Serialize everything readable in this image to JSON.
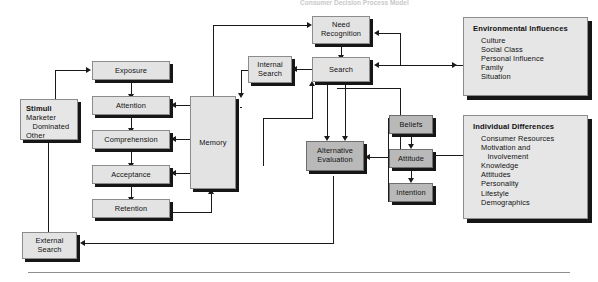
{
  "figure": {
    "title": "Consumer Decision Process Model",
    "title_clipped": true
  },
  "nodes": {
    "stimuli": {
      "title": "Stimuli",
      "lines": [
        "Marketer",
        "   Dominated",
        "Other"
      ]
    },
    "exposure": {
      "label": "Exposure"
    },
    "attention": {
      "label": "Attention"
    },
    "comprehension": {
      "label": "Comprehension"
    },
    "acceptance": {
      "label": "Acceptance"
    },
    "retention": {
      "label": "Retention"
    },
    "memory": {
      "label": "Memory"
    },
    "external_search": {
      "label": "External\nSearch",
      "line1": "External",
      "line2": "Search"
    },
    "internal_search": {
      "label": "Internal\nSearch",
      "line1": "Internal",
      "line2": "Search"
    },
    "need_recognition": {
      "line1": "Need",
      "line2": "Recognition"
    },
    "search": {
      "label": "Search"
    },
    "alternative_evaluation": {
      "line1": "Alternative",
      "line2": "Evaluation"
    },
    "beliefs": {
      "label": "Beliefs"
    },
    "attitude": {
      "label": "Attitude"
    },
    "intention": {
      "label": "Intention"
    }
  },
  "panels": {
    "environmental": {
      "title": "Environmental Influences",
      "items": [
        "Culture",
        "Social Class",
        "Personal Influence",
        "Family",
        "Situation"
      ]
    },
    "individual": {
      "title": "Individual Differences",
      "items": [
        "Consumer Resources",
        "Motivation and",
        "   Involvement",
        "Knowledge",
        "Attitudes",
        "Personality",
        "Lifestyle",
        "Demographics"
      ]
    }
  },
  "colors": {
    "box_fill": "#e3e3e3",
    "dark_box_fill": "#b9b9b9",
    "panel_fill": "#e6e6e6",
    "border": "#8c8c8c",
    "shadow": "#161616",
    "connector": "#1a1a1a",
    "page_background": "#ffffff"
  }
}
